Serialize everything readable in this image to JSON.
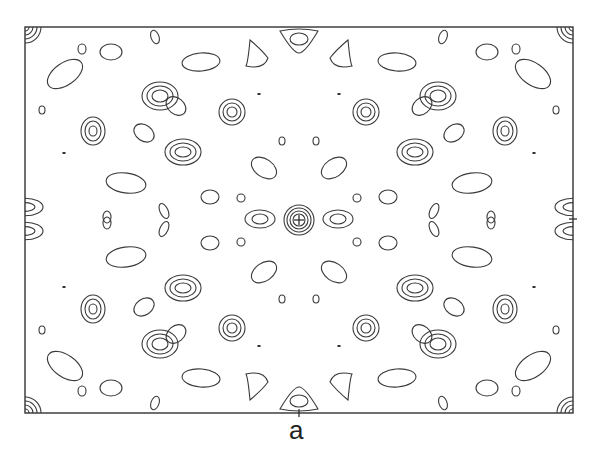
{
  "figure": {
    "panel_label": "a",
    "frame": {
      "x": 25,
      "y": 27,
      "w": 548,
      "h": 386
    },
    "center": {
      "x": 299,
      "y": 220
    },
    "colors": {
      "line": "#3a3a3a",
      "background": "#ffffff"
    },
    "peaks_quadrant": [
      {
        "x": 160,
        "y": 96,
        "rx": [
          18,
          13,
          8
        ],
        "ry": [
          14,
          10,
          6
        ]
      },
      {
        "x": 93,
        "y": 131,
        "rx": [
          12,
          8,
          4
        ],
        "ry": [
          14,
          10,
          5
        ]
      },
      {
        "x": 183,
        "y": 152,
        "rx": [
          18,
          13,
          8
        ],
        "ry": [
          13,
          9,
          5
        ]
      },
      {
        "x": 232,
        "y": 112,
        "rx": [
          13,
          9,
          5
        ],
        "ry": [
          13,
          9,
          5
        ]
      }
    ],
    "blobs_quadrant": [
      {
        "x": 65,
        "y": 74,
        "rx": 20,
        "ry": 11,
        "rot": -35
      },
      {
        "x": 111,
        "y": 52,
        "rx": 11,
        "ry": 8,
        "rot": 0
      },
      {
        "x": 82,
        "y": 49,
        "rx": 4,
        "ry": 5,
        "rot": 0
      },
      {
        "x": 42,
        "y": 110,
        "rx": 3,
        "ry": 4,
        "rot": 0
      },
      {
        "x": 201,
        "y": 62,
        "rx": 19,
        "ry": 9,
        "rot": -5
      },
      {
        "x": 176,
        "y": 106,
        "rx": 11,
        "ry": 8,
        "rot": 40
      },
      {
        "x": 144,
        "y": 133,
        "rx": 11,
        "ry": 8,
        "rot": 35
      },
      {
        "x": 126,
        "y": 183,
        "rx": 20,
        "ry": 10,
        "rot": 8
      },
      {
        "x": 210,
        "y": 197,
        "rx": 9,
        "ry": 7,
        "rot": 0
      },
      {
        "x": 241,
        "y": 198,
        "rx": 4,
        "ry": 4,
        "rot": 0
      },
      {
        "x": 107,
        "y": 217,
        "rx": 4,
        "ry": 6,
        "rot": 0
      },
      {
        "x": 164,
        "y": 211,
        "rx": 4,
        "ry": 8,
        "rot": -25
      },
      {
        "x": 264,
        "y": 168,
        "rx": 14,
        "ry": 9,
        "rot": 35
      },
      {
        "x": 282,
        "y": 141,
        "rx": 3,
        "ry": 4,
        "rot": 0
      },
      {
        "x": 155,
        "y": 37,
        "rx": 4,
        "ry": 7,
        "rot": -20
      },
      {
        "x": 41,
        "y": 44,
        "rx": 0,
        "ry": 0,
        "rot": 0
      }
    ],
    "dots_quadrant": [
      {
        "x": 64,
        "y": 153
      },
      {
        "x": 259,
        "y": 94
      }
    ],
    "center_peak": {
      "rings": [
        15,
        12,
        9,
        6
      ],
      "cross": 5
    },
    "side_peaks": [
      {
        "x": 260,
        "y": 219,
        "rx": [
          15,
          8
        ],
        "ry": [
          9,
          5
        ]
      },
      {
        "x": 338,
        "y": 219,
        "rx": [
          15,
          8
        ],
        "ry": [
          9,
          5
        ]
      }
    ],
    "edge_top": {
      "x": 299,
      "outer": {
        "w": 38,
        "h": 26
      },
      "inner": {
        "rx": 9,
        "ry": 6
      }
    },
    "edge_left": {
      "y": 219,
      "rx": [
        18,
        10
      ],
      "ry": [
        14,
        7
      ]
    },
    "corner_rings": [
      4,
      8,
      12,
      16
    ],
    "side_sharks": [
      {
        "x": 264,
        "y": 52
      },
      {
        "x": 334,
        "y": 52
      }
    ],
    "ticks": {
      "bottom_x": 299,
      "right_y": 219
    }
  }
}
